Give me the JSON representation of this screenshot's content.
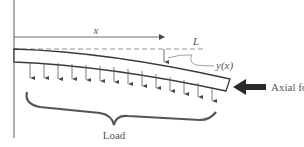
{
  "figure": {
    "type": "cantilever beam under distributed load and axial force",
    "labels": {
      "x": "x",
      "L": "L",
      "deflection": "y(x)",
      "axial_force": "Axial force",
      "load": "Load"
    },
    "load_arrow_count": 14,
    "colors": {
      "line": "#4a4a4a",
      "wall": "#777777",
      "dashed": "#888888",
      "axial_arrow": "#2a2a2a",
      "text": "#555555"
    }
  }
}
